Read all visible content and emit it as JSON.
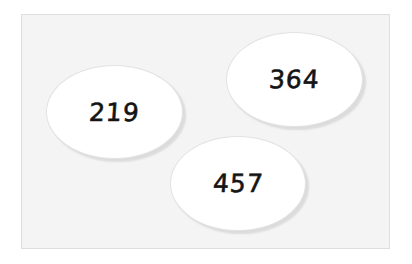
{
  "diagram": {
    "background_color": "#f4f4f4",
    "oval_fill": "#ffffff",
    "text_color": "#141414",
    "ovals": [
      {
        "label": "219",
        "position": "left"
      },
      {
        "label": "364",
        "position": "top-right"
      },
      {
        "label": "457",
        "position": "bottom-center"
      }
    ]
  }
}
